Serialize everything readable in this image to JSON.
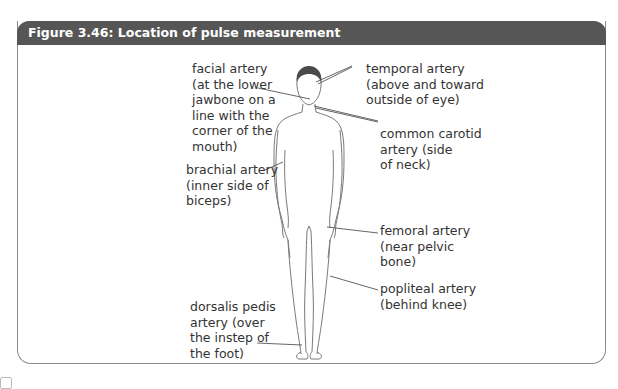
{
  "figure": {
    "title": "Figure 3.46: Location of pulse measurement",
    "header_color": "#565656",
    "labels": {
      "facial": "facial artery\n(at the lower\njawbone on a\nline with the\ncorner of the\nmouth)",
      "temporal": "temporal artery\n(above and toward\noutside of eye)",
      "carotid": "common carotid\nartery (side\nof neck)",
      "brachial": "brachial artery\n(inner side of\nbiceps)",
      "femoral": "femoral artery\n(near pelvic\nbone)",
      "popliteal": "popliteal artery\n(behind knee)",
      "dorsalis": "dorsalis pedis\nartery (over\nthe instep of\nthe foot)"
    }
  }
}
